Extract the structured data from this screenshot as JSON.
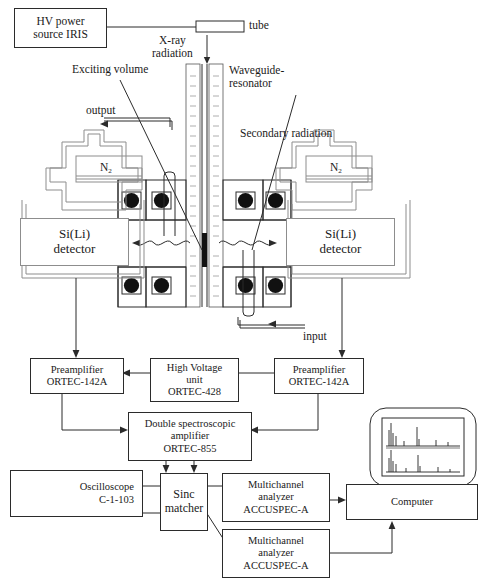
{
  "diagram": {
    "annotations": {
      "hv_source": "HV power\nsource IRIS",
      "hv_source_l1": "HV power",
      "hv_source_l2": "source IRIS",
      "tube": "tube",
      "xray_l1": "X-ray",
      "xray_l2": "radiation",
      "exciting_volume": "Exciting volume",
      "waveguide_l1": "Waveguide-",
      "waveguide_l2": "resonator",
      "secondary_radiation": "Secondary radiation",
      "output": "output",
      "input": "input",
      "nitrogen": "N",
      "nitrogen_sub": "2",
      "detector_l1": "Si(Li)",
      "detector_l2": "detector"
    },
    "blocks": [
      {
        "id": "preamp-left",
        "lines": [
          "Preamplifier",
          "ORTEC-142A"
        ]
      },
      {
        "id": "hv-unit",
        "lines": [
          "High Voltage",
          "unit",
          "ORTEC-428"
        ]
      },
      {
        "id": "preamp-right",
        "lines": [
          "Preamplifier",
          "ORTEC-142A"
        ]
      },
      {
        "id": "dsa",
        "lines": [
          "Double spectroscopic",
          "amplifier",
          "ORTEC-855"
        ]
      },
      {
        "id": "oscilloscope",
        "lines": [
          "Oscilloscope",
          "C-1-103"
        ]
      },
      {
        "id": "sinc-matcher",
        "lines": [
          "Sinc",
          "matcher"
        ]
      },
      {
        "id": "mca-1",
        "lines": [
          "Multichannel",
          "analyzer",
          "ACCUSPEC-A"
        ]
      },
      {
        "id": "mca-2",
        "lines": [
          "Multichannel",
          "analyzer",
          "ACCUSPEC-A"
        ]
      },
      {
        "id": "computer",
        "lines": [
          "Computer"
        ]
      }
    ],
    "monitor": {
      "spectrum_top_label": "1",
      "spectrum_bottom_label": "2"
    },
    "colors": {
      "line": "#2b2b2b",
      "grey_line": "#8d8d8d",
      "oring": "#111111",
      "background": "#ffffff"
    }
  }
}
